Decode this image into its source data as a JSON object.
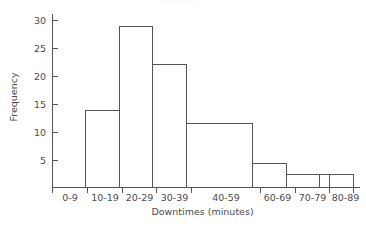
{
  "chart_data": {
    "type": "bar",
    "title": "",
    "title_fragment": "........ ..",
    "xlabel": "Downtimes (minutes)",
    "ylabel": "Frequency",
    "categories": [
      "0-9",
      "10-19",
      "20-29",
      "30-39",
      "40-59",
      "60-69",
      "70-79",
      "80-89"
    ],
    "values": [
      2.6,
      13.8,
      28.9,
      22.1,
      11.5,
      4.3,
      2.3,
      2.3
    ],
    "bin_widths": [
      1,
      1,
      1,
      1,
      2,
      1,
      1,
      1
    ],
    "bin_edges": [
      0,
      10,
      20,
      30,
      40,
      60,
      70,
      80,
      90
    ],
    "ylim": [
      0,
      31
    ],
    "yticks": [
      5,
      10,
      15,
      20,
      25,
      30
    ],
    "ytick_labels": [
      "5",
      "10",
      "15",
      "20",
      "25",
      "30"
    ],
    "xtick_labels": [
      "0-9",
      "10-19",
      "20-29",
      "30-39",
      "40-59",
      "60-69",
      "70-79",
      "80-89"
    ],
    "grid": false,
    "legend": null,
    "bar_fill": "#ffffff",
    "bar_stroke": "#555555",
    "axis_color": "#555555",
    "background": "#ffffff"
  }
}
